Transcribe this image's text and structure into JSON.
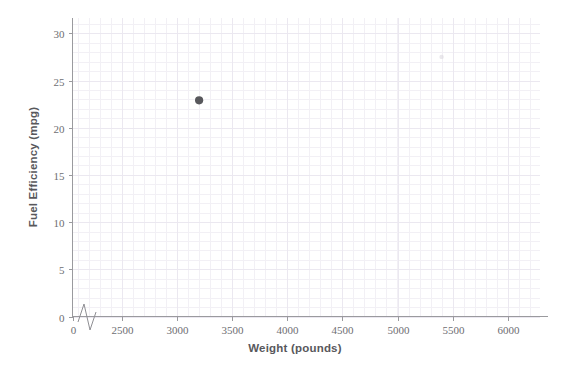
{
  "chart_data": {
    "type": "scatter",
    "title": "",
    "xlabel": "Weight (pounds)",
    "ylabel": "Fuel Efficiency (mpg)",
    "xlim": [
      0,
      6250
    ],
    "ylim": [
      0,
      31.5
    ],
    "x_break": {
      "present": true,
      "from": 0,
      "to": 2500,
      "symbol": "zigzag"
    },
    "xticks": [
      0,
      2500,
      3000,
      3500,
      4000,
      4500,
      5000,
      5500,
      6000
    ],
    "xticklabels": [
      "0",
      "2500",
      "3000",
      "3500",
      "4000",
      "4500",
      "5000",
      "5500",
      "6000"
    ],
    "yticks": [
      0,
      5,
      10,
      15,
      20,
      25,
      30
    ],
    "yticklabels": [
      "0",
      "5",
      "10",
      "15",
      "20",
      "25",
      "30"
    ],
    "grid": "minor-and-major",
    "legend": "none",
    "series": [
      {
        "name": "cars",
        "marker": "circle",
        "color": "#58585c",
        "points": [
          {
            "x": 3200,
            "y": 22.9,
            "emphasis": "strong"
          },
          {
            "x": 5400,
            "y": 27.5,
            "emphasis": "faint"
          }
        ]
      }
    ],
    "x": [
      3200,
      5400
    ],
    "y": [
      22.9,
      27.5
    ],
    "point_count": 2
  },
  "axes": {
    "x_title": "Weight (pounds)",
    "y_title": "Fuel Efficiency (mpg)",
    "x_tick_labels": [
      "0",
      "2500",
      "3000",
      "3500",
      "4000",
      "4500",
      "5000",
      "5500",
      "6000"
    ],
    "y_tick_labels": [
      "0",
      "5",
      "10",
      "15",
      "20",
      "25",
      "30"
    ]
  },
  "colors": {
    "background": "#ffffff",
    "grid_minor": "#f2f0f5",
    "grid_major": "#ebe8f0",
    "axis": "#9a9a9e",
    "tick_text": "#6e6e72",
    "title_text": "#58585c",
    "point_strong": "#58585c",
    "point_faint": "#d8d6dc"
  }
}
